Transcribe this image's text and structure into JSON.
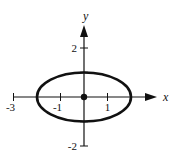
{
  "chart_data": {
    "type": "line",
    "title": "",
    "xlabel": "x",
    "ylabel": "y",
    "xlim": [
      -3,
      3
    ],
    "ylim": [
      -2,
      3
    ],
    "grid": false,
    "x_ticks": [
      {
        "value": -3,
        "label": "-3"
      },
      {
        "value": -1,
        "label": "-1"
      },
      {
        "value": 1,
        "label": "1"
      }
    ],
    "y_ticks": [
      {
        "value": 2,
        "label": "2"
      },
      {
        "value": -2,
        "label": "-2"
      }
    ],
    "series": [
      {
        "name": "ellipse",
        "shape": "ellipse",
        "center": [
          0,
          0
        ],
        "semi_axis_x": 2,
        "semi_axis_y": 1,
        "equation": "x^2/4 + y^2 = 1"
      }
    ],
    "points": [
      {
        "name": "center",
        "x": 0,
        "y": 0
      }
    ],
    "color": "#111111"
  }
}
